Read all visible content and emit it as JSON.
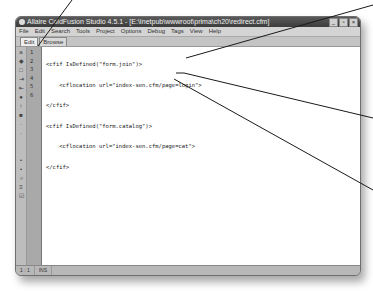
{
  "window": {
    "title": "Allaire ColdFusion Studio 4.5.1 - [E:\\Inetpub\\wwwroot\\prima\\ch20\\redirect.cfm]",
    "controls": [
      "minimize",
      "restore",
      "close"
    ]
  },
  "menubar": {
    "items": [
      "File",
      "Edit",
      "Search",
      "Tools",
      "Project",
      "Options",
      "Debug",
      "Tags",
      "View",
      "Help"
    ]
  },
  "tabs": [
    {
      "label": "Edit",
      "active": true
    },
    {
      "label": "Browse",
      "active": false
    }
  ],
  "toolstrip": {
    "icons": [
      "tag-icon",
      "bookmark-icon",
      "box-icon",
      "indent-icon",
      "outdent-icon",
      "comment-icon",
      "marker-icon",
      "block-icon",
      "dot-icon",
      "dot-icon",
      "blank-icon",
      "blank-icon",
      "arrow-icon",
      "arrow-icon",
      "search-icon",
      "list-icon",
      "validate-icon"
    ]
  },
  "editor": {
    "line_numbers": [
      "1",
      "2",
      "3",
      "4",
      "5",
      "6"
    ],
    "lines": [
      "<cfif IsDefined(\"form.join\")>",
      "    <cflocation url=\"index-sen.cfm/page=login\">",
      "</cfif>",
      "<cfif IsDefined(\"form.catalog\")>",
      "    <cflocation url=\"index-sen.cfm/page=cat\">",
      "</cfif>"
    ]
  },
  "statusbar": {
    "position": "1 : 1",
    "mode": "INS"
  }
}
